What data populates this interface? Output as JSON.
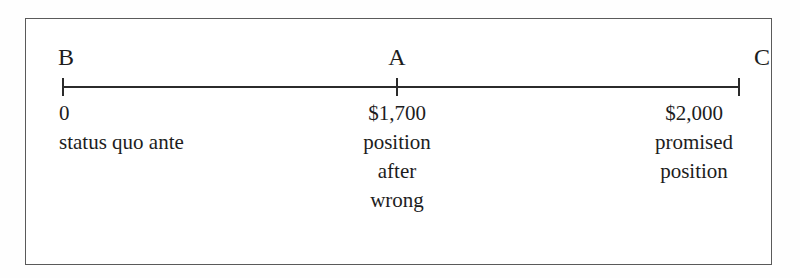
{
  "figure": {
    "type": "number-line-diagram",
    "frame_color": "#5a5a5a",
    "line_color": "#2b2b2b",
    "background": "#ffffff"
  },
  "points": {
    "b": {
      "letter": "B",
      "value": "0",
      "description_lines": [
        "status quo ante"
      ]
    },
    "a": {
      "letter": "A",
      "value": "$1,700",
      "description_lines": [
        "position",
        "after",
        "wrong"
      ]
    },
    "c": {
      "letter": "C",
      "value": "$2,000",
      "description_lines": [
        "promised",
        "position"
      ]
    }
  },
  "chart_data": {
    "type": "line",
    "title": "",
    "xlabel": "",
    "ylabel": "",
    "axis_orientation": "horizontal",
    "grid": false,
    "legend": "none",
    "xlim": [
      0,
      2000
    ],
    "tick_labels": [
      "0",
      "$1,700",
      "$2,000"
    ],
    "point_labels": [
      "B",
      "A",
      "C"
    ],
    "x": [
      0,
      1700,
      2000
    ],
    "annotations": [
      "status quo ante",
      "position after wrong",
      "promised position"
    ]
  }
}
